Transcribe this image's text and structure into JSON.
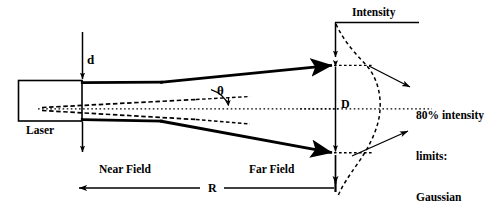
{
  "figure": {
    "type": "technical-line-diagram",
    "background_color": "#ffffff",
    "line_color": "#000000",
    "canvas": {
      "width": 500,
      "height": 213
    }
  },
  "labels": {
    "laser": "Laser",
    "beam_diameter": "d",
    "divergence_angle": "θ",
    "far_field_diameter": "D",
    "intensity_axis": "Intensity",
    "near_field": "Near Field",
    "far_field": "Far Field",
    "range": "R",
    "annotation_lines": [
      "80% intensity",
      "limits:",
      "Gaussian",
      "profile"
    ],
    "annotation_text": "80% intensity limits: Gaussian profile"
  },
  "geometry": {
    "laser_box": {
      "x": 18,
      "y": 80,
      "width": 64,
      "height": 41
    },
    "centerline": {
      "x1": 40,
      "y1": 109,
      "x2": 500,
      "y2": 109
    },
    "beam_upper_edge": {
      "x1": 82,
      "y1": 83,
      "x2": 335,
      "y2": 65
    },
    "beam_lower_edge": {
      "x1": 82,
      "y1": 119,
      "x2": 335,
      "y2": 153
    },
    "aperture_plane_x": 82,
    "far_field_plane_x": 335,
    "far_field_top_y": 65,
    "far_field_bottom_y": 153,
    "dimension_line_y": 188,
    "intensity_axis": {
      "x": 335,
      "y": 22,
      "length": 95
    }
  },
  "elements": [
    {
      "name": "laser-housing",
      "kind": "rectangle",
      "stroke": "#000000"
    },
    {
      "name": "beam-edge-upper",
      "kind": "thick-line-with-arrowhead"
    },
    {
      "name": "beam-edge-lower",
      "kind": "thick-line-with-arrowhead"
    },
    {
      "name": "beam-waist-dashed-upper",
      "kind": "dashed-line"
    },
    {
      "name": "beam-waist-dashed-lower",
      "kind": "dashed-line"
    },
    {
      "name": "optical-axis",
      "kind": "dotted-line"
    },
    {
      "name": "gaussian-profile-curve",
      "kind": "dashed-curve"
    },
    {
      "name": "d-dimension",
      "kind": "double-arrow-vertical"
    },
    {
      "name": "D-dimension",
      "kind": "double-arrow-vertical"
    },
    {
      "name": "R-dimension",
      "kind": "double-arrow-horizontal"
    },
    {
      "name": "theta-angle-arc",
      "kind": "angle-indicator"
    },
    {
      "name": "annotation-leader-upper",
      "kind": "arrow"
    },
    {
      "name": "annotation-leader-lower",
      "kind": "arrow"
    }
  ]
}
